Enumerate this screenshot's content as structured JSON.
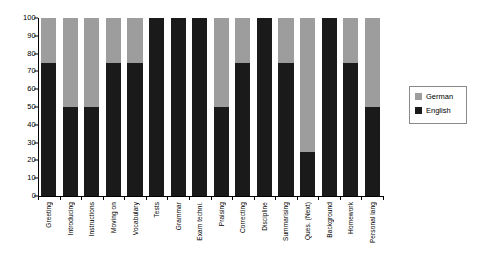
{
  "chart_data": {
    "type": "bar",
    "stacked": true,
    "stack_mode": "percent",
    "title": "",
    "xlabel": "",
    "ylabel": "",
    "ylim": [
      0,
      100
    ],
    "ytick_labels": [
      "100",
      "90",
      "80",
      "70",
      "60",
      "50",
      "40",
      "30",
      "20",
      "10",
      "0"
    ],
    "ytick_values": [
      100,
      90,
      80,
      70,
      60,
      50,
      40,
      30,
      20,
      10,
      0
    ],
    "grid": false,
    "legend_position": "right",
    "categories": [
      "Greeting",
      "Introducing",
      "Instructions",
      "Moving on",
      "Vocabulary",
      "Tests",
      "Grammar",
      "Exam techni.",
      "Praising",
      "Correcting",
      "Discipline",
      "Summarising",
      "Ques. (Next)",
      "Background",
      "Homework",
      "Personal lang"
    ],
    "series": [
      {
        "name": "English",
        "color": "#1a1a1a",
        "values": [
          75,
          50,
          50,
          75,
          75,
          100,
          100,
          100,
          50,
          75,
          100,
          75,
          25,
          100,
          75,
          50
        ]
      },
      {
        "name": "German",
        "color": "#9d9d9d",
        "values": [
          25,
          50,
          50,
          25,
          25,
          0,
          0,
          0,
          50,
          25,
          0,
          25,
          75,
          0,
          25,
          50
        ]
      }
    ]
  },
  "legend": {
    "entries": [
      {
        "label": "German",
        "color": "#9d9d9d"
      },
      {
        "label": "English",
        "color": "#1a1a1a"
      }
    ]
  }
}
